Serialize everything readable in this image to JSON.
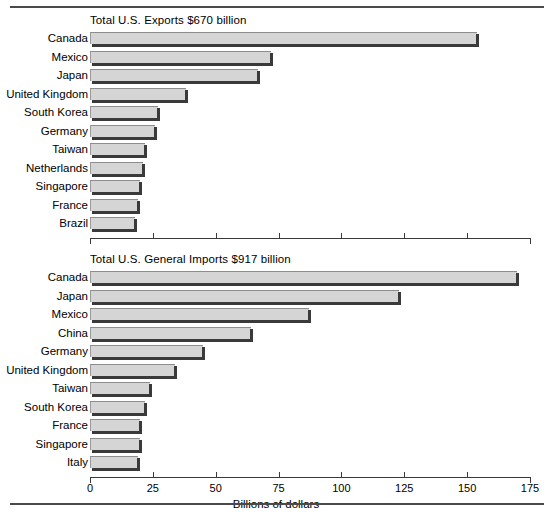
{
  "chart_data": [
    {
      "type": "bar",
      "orientation": "horizontal",
      "title": "Total U.S. Exports $670 billion",
      "xlabel": "",
      "ylabel": "",
      "xlim": [
        0,
        175
      ],
      "ticks": [
        0,
        25,
        50,
        75,
        100,
        125,
        150,
        175
      ],
      "tick_labels": [
        "0",
        "25",
        "50",
        "75",
        "100",
        "125",
        "150",
        "175"
      ],
      "grid": false,
      "legend": "none",
      "categories": [
        "Canada",
        "Mexico",
        "Japan",
        "United Kingdom",
        "South Korea",
        "Germany",
        "Taiwan",
        "Netherlands",
        "Singapore",
        "France",
        "Brazil"
      ],
      "values": [
        154,
        72,
        67,
        38,
        27,
        26,
        22,
        21,
        20,
        19,
        18
      ]
    },
    {
      "type": "bar",
      "orientation": "horizontal",
      "title": "Total U.S. General Imports $917 billion",
      "xlabel": "Billions of dollars",
      "ylabel": "",
      "xlim": [
        0,
        175
      ],
      "ticks": [
        0,
        25,
        50,
        75,
        100,
        125,
        150,
        175
      ],
      "tick_labels": [
        "0",
        "25",
        "50",
        "75",
        "100",
        "125",
        "150",
        "175"
      ],
      "grid": false,
      "legend": "none",
      "categories": [
        "Canada",
        "Japan",
        "Mexico",
        "China",
        "Germany",
        "United Kingdom",
        "Taiwan",
        "South Korea",
        "France",
        "Singapore",
        "Italy"
      ],
      "values": [
        170,
        123,
        87,
        64,
        45,
        34,
        24,
        22,
        20,
        20,
        19
      ]
    }
  ],
  "exports": {
    "title": "Total U.S. Exports $670 billion",
    "rows": [
      {
        "label": "Canada",
        "value": 154
      },
      {
        "label": "Mexico",
        "value": 72
      },
      {
        "label": "Japan",
        "value": 67
      },
      {
        "label": "United Kingdom",
        "value": 38
      },
      {
        "label": "South Korea",
        "value": 27
      },
      {
        "label": "Germany",
        "value": 26
      },
      {
        "label": "Taiwan",
        "value": 22
      },
      {
        "label": "Netherlands",
        "value": 21
      },
      {
        "label": "Singapore",
        "value": 20
      },
      {
        "label": "France",
        "value": 19
      },
      {
        "label": "Brazil",
        "value": 18
      }
    ],
    "axis": {
      "labels": [
        "0",
        "25",
        "50",
        "75",
        "100",
        "125",
        "150",
        "175"
      ],
      "title": ""
    }
  },
  "imports": {
    "title": "Total U.S. General Imports $917 billion",
    "rows": [
      {
        "label": "Canada",
        "value": 170
      },
      {
        "label": "Japan",
        "value": 123
      },
      {
        "label": "Mexico",
        "value": 87
      },
      {
        "label": "China",
        "value": 64
      },
      {
        "label": "Germany",
        "value": 45
      },
      {
        "label": "United Kingdom",
        "value": 34
      },
      {
        "label": "Taiwan",
        "value": 24
      },
      {
        "label": "South Korea",
        "value": 22
      },
      {
        "label": "France",
        "value": 20
      },
      {
        "label": "Singapore",
        "value": 20
      },
      {
        "label": "Italy",
        "value": 19
      }
    ],
    "axis": {
      "labels": [
        "0",
        "25",
        "50",
        "75",
        "100",
        "125",
        "150",
        "175"
      ],
      "title": "Billions of dollars"
    }
  },
  "style": {
    "bar_fill": "#d5d5d5",
    "bar_shadow": "#3a3a3a",
    "rule_color": "#4a4a4a",
    "text_color": "#000000"
  }
}
